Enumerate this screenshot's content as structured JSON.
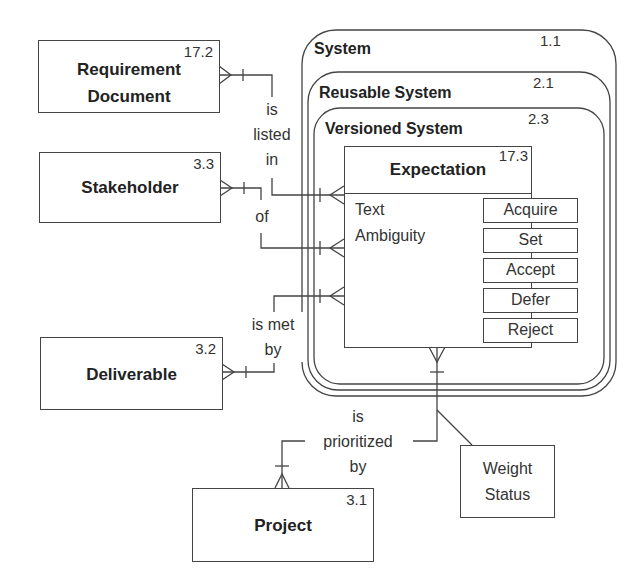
{
  "entities": {
    "requirement_document": {
      "name": "Requirement Document",
      "line1": "Requirement",
      "line2": "Document",
      "ref": "17.2"
    },
    "stakeholder": {
      "name": "Stakeholder",
      "ref": "3.3"
    },
    "deliverable": {
      "name": "Deliverable",
      "ref": "3.2"
    },
    "project": {
      "name": "Project",
      "ref": "3.1"
    },
    "expectation": {
      "name": "Expectation",
      "ref": "17.3",
      "attributes": [
        "Text",
        "Ambiguity"
      ],
      "operations": [
        "Acquire",
        "Set",
        "Accept",
        "Defer",
        "Reject"
      ]
    }
  },
  "systems": [
    {
      "name": "System",
      "ref": "1.1"
    },
    {
      "name": "Reusable System",
      "ref": "2.1"
    },
    {
      "name": "Versioned System",
      "ref": "2.3"
    }
  ],
  "relationships": {
    "listed_in": {
      "line1": "is",
      "line2": "listed",
      "line3": "in"
    },
    "of": {
      "line1": "of"
    },
    "met_by": {
      "line1": "is met",
      "line2": "by"
    },
    "prioritized_by": {
      "line1": "is",
      "line2": "prioritized",
      "line3": "by"
    }
  },
  "association_attributes": {
    "line1": "Weight",
    "line2": "Status"
  }
}
